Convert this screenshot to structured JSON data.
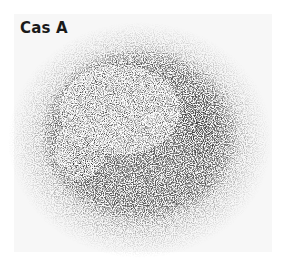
{
  "image": {
    "subject": "Cas A supernova remnant",
    "label": "Cas A",
    "colormap": "grayscale",
    "colors": {
      "background": "#ffffff",
      "frame": "#f7f7f7",
      "nebula_mid": "#6e6e6e",
      "nebula_dark": "#2a2a2a",
      "label_text": "#1a1a1a"
    }
  }
}
